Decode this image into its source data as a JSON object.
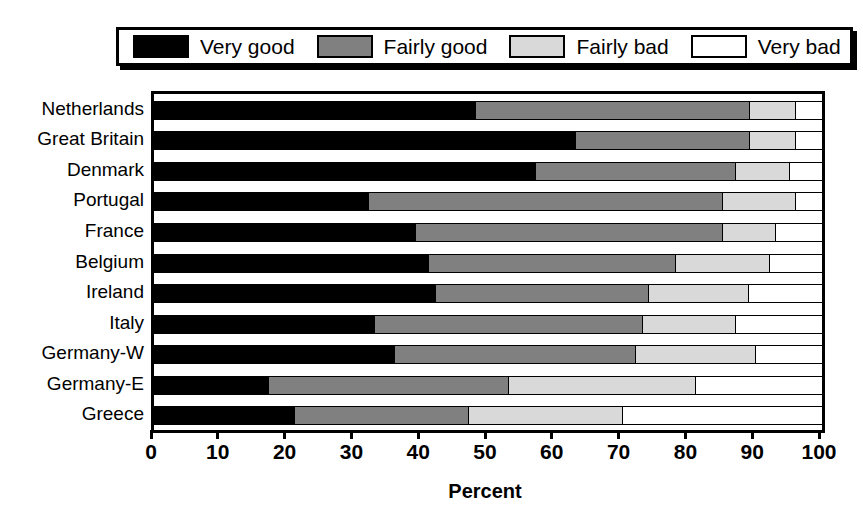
{
  "chart_data": {
    "type": "bar",
    "orientation": "horizontal",
    "stacked": true,
    "stacked_percent": true,
    "title": "",
    "subtitle": "",
    "xlabel": "Percent",
    "ylabel": "",
    "xlim": [
      0,
      100
    ],
    "xticks": [
      0,
      10,
      20,
      30,
      40,
      50,
      60,
      70,
      80,
      90,
      100
    ],
    "xtick_labels": [
      "0",
      "10",
      "20",
      "30",
      "40",
      "50",
      "60",
      "70",
      "80",
      "90",
      "100"
    ],
    "grid": false,
    "legend_position": "top",
    "legend": [
      "Very good",
      "Fairly good",
      "Fairly bad",
      "Very bad"
    ],
    "categories": [
      "Netherlands",
      "Great Britain",
      "Denmark",
      "Portugal",
      "France",
      "Belgium",
      "Ireland",
      "Italy",
      "Germany-W",
      "Germany-E",
      "Greece"
    ],
    "series": [
      {
        "name": "Very good",
        "color": "#000000",
        "values": [
          48,
          63,
          57,
          32,
          39,
          41,
          42,
          33,
          36,
          17,
          21
        ]
      },
      {
        "name": "Fairly good",
        "color": "#808080",
        "values": [
          41,
          26,
          30,
          53,
          46,
          37,
          32,
          40,
          36,
          36,
          26
        ]
      },
      {
        "name": "Fairly bad",
        "color": "#d9d9d9",
        "values": [
          7,
          7,
          8,
          11,
          8,
          14,
          15,
          14,
          18,
          28,
          23
        ]
      },
      {
        "name": "Very bad",
        "color": "#ffffff",
        "values": [
          4,
          4,
          5,
          4,
          7,
          8,
          11,
          13,
          10,
          19,
          30
        ]
      }
    ],
    "cumulative_boundaries": [
      [
        48,
        89,
        96
      ],
      [
        63,
        89,
        96
      ],
      [
        57,
        87,
        95
      ],
      [
        32,
        85,
        96
      ],
      [
        39,
        85,
        93
      ],
      [
        41,
        78,
        92
      ],
      [
        42,
        74,
        89
      ],
      [
        33,
        73,
        87
      ],
      [
        36,
        72,
        90
      ],
      [
        17,
        53,
        81
      ],
      [
        21,
        47,
        70
      ]
    ]
  },
  "colors": {
    "very_good": "#000000",
    "fairly_good": "#808080",
    "fairly_bad": "#d9d9d9",
    "very_bad": "#ffffff",
    "axis": "#000000",
    "background": "#ffffff"
  }
}
